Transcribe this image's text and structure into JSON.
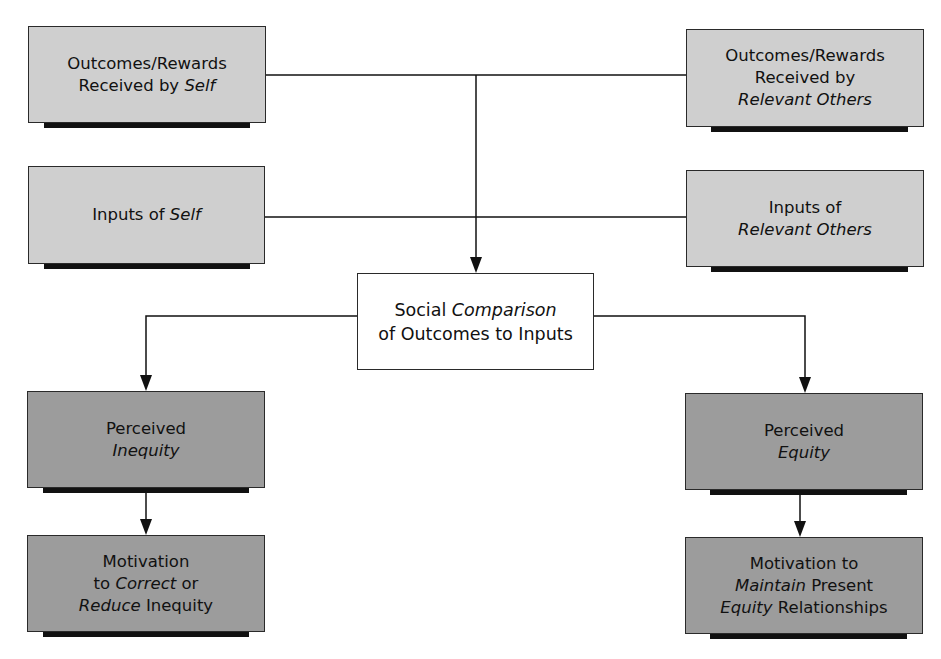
{
  "diagram": {
    "type": "flowchart",
    "colors": {
      "light_box": "#cfcfcf",
      "dark_box": "#9c9c9c",
      "center_box": "#ffffff",
      "line": "#111111",
      "shadow": "#111111"
    },
    "nodes": {
      "outcomes_self": {
        "lines": [
          [
            {
              "t": "Outcomes/Rewards",
              "i": false
            }
          ],
          [
            {
              "t": "Received by ",
              "i": false
            },
            {
              "t": "Self",
              "i": true
            }
          ]
        ]
      },
      "outcomes_others": {
        "lines": [
          [
            {
              "t": "Outcomes/Rewards",
              "i": false
            }
          ],
          [
            {
              "t": "Received by",
              "i": false
            }
          ],
          [
            {
              "t": "Relevant Others",
              "i": true
            }
          ]
        ]
      },
      "inputs_self": {
        "lines": [
          [
            {
              "t": "Inputs of ",
              "i": false
            },
            {
              "t": "Self",
              "i": true
            }
          ]
        ]
      },
      "inputs_others": {
        "lines": [
          [
            {
              "t": "Inputs of",
              "i": false
            }
          ],
          [
            {
              "t": "Relevant Others",
              "i": true
            }
          ]
        ]
      },
      "social_comparison": {
        "lines": [
          [
            {
              "t": "Social ",
              "i": false
            },
            {
              "t": "Comparison",
              "i": true
            }
          ],
          [
            {
              "t": "of Outcomes to Inputs",
              "i": false
            }
          ]
        ]
      },
      "perceived_inequity": {
        "lines": [
          [
            {
              "t": "Perceived",
              "i": false
            }
          ],
          [
            {
              "t": "Inequity",
              "i": true
            }
          ]
        ]
      },
      "perceived_equity": {
        "lines": [
          [
            {
              "t": "Perceived",
              "i": false
            }
          ],
          [
            {
              "t": "Equity",
              "i": true
            }
          ]
        ]
      },
      "motivation_correct": {
        "lines": [
          [
            {
              "t": "Motivation",
              "i": false
            }
          ],
          [
            {
              "t": "to ",
              "i": false
            },
            {
              "t": "Correct",
              "i": true
            },
            {
              "t": " or",
              "i": false
            }
          ],
          [
            {
              "t": "Reduce",
              "i": true
            },
            {
              "t": " Inequity",
              "i": false
            }
          ]
        ]
      },
      "motivation_maintain": {
        "lines": [
          [
            {
              "t": "Motivation to",
              "i": false
            }
          ],
          [
            {
              "t": "Maintain",
              "i": true
            },
            {
              "t": " Present",
              "i": false
            }
          ],
          [
            {
              "t": "Equity",
              "i": true
            },
            {
              "t": " Relationships",
              "i": false
            }
          ]
        ]
      }
    },
    "edges": [
      {
        "from": "outcomes_self",
        "to": "social_comparison"
      },
      {
        "from": "outcomes_others",
        "to": "social_comparison"
      },
      {
        "from": "inputs_self",
        "to": "social_comparison"
      },
      {
        "from": "inputs_others",
        "to": "social_comparison"
      },
      {
        "from": "social_comparison",
        "to": "perceived_inequity"
      },
      {
        "from": "social_comparison",
        "to": "perceived_equity"
      },
      {
        "from": "perceived_inequity",
        "to": "motivation_correct"
      },
      {
        "from": "perceived_equity",
        "to": "motivation_maintain"
      }
    ]
  }
}
